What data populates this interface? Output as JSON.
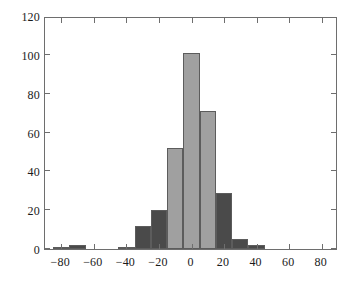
{
  "figure": {
    "name": "histogram-figure",
    "background_color": "#ffffff",
    "axis_color": "#6e6e6e",
    "text_color": "#1a1a1a"
  },
  "chart_data": {
    "type": "bar",
    "title": "",
    "subtitle": "",
    "xlabel": "",
    "ylabel": "",
    "xlim": [
      -90,
      90
    ],
    "ylim": [
      0,
      120
    ],
    "grid": false,
    "legend": null,
    "bin_width": 10,
    "xticks": [
      -80,
      -60,
      -40,
      -20,
      0,
      20,
      40,
      60,
      80
    ],
    "xtick_labels": [
      "−80",
      "−60",
      "−40",
      "−20",
      "0",
      "20",
      "40",
      "60",
      "80"
    ],
    "yticks": [
      0,
      20,
      40,
      60,
      80,
      100,
      120
    ],
    "ytick_labels": [
      "0",
      "20",
      "40",
      "60",
      "80",
      "100",
      "120"
    ],
    "colors": {
      "light_bar": "#a0a0a0",
      "dark_bar": "#4a4a4a",
      "bar_edge": "#5c5c5c"
    },
    "bin_left_edges": [
      -85,
      -75,
      -45,
      -35,
      -25,
      -15,
      -5,
      5,
      15,
      25,
      35
    ],
    "categories": [
      "-85",
      "-75",
      "-45",
      "-35",
      "-25",
      "-15",
      "-5",
      "5",
      "15",
      "25",
      "35"
    ],
    "values": [
      1,
      2,
      1,
      12,
      20,
      52,
      101,
      71,
      29,
      5,
      2
    ],
    "bars": [
      {
        "left": -85,
        "right": -75,
        "value": 1,
        "color": "dark"
      },
      {
        "left": -75,
        "right": -65,
        "value": 2,
        "color": "dark"
      },
      {
        "left": -45,
        "right": -35,
        "value": 1,
        "color": "dark"
      },
      {
        "left": -35,
        "right": -25,
        "value": 12,
        "color": "dark"
      },
      {
        "left": -25,
        "right": -15,
        "value": 20,
        "color": "dark"
      },
      {
        "left": -15,
        "right": -5,
        "value": 52,
        "color": "light"
      },
      {
        "left": -5,
        "right": 5,
        "value": 101,
        "color": "light"
      },
      {
        "left": 5,
        "right": 15,
        "value": 71,
        "color": "light"
      },
      {
        "left": 15,
        "right": 25,
        "value": 29,
        "color": "dark"
      },
      {
        "left": 25,
        "right": 35,
        "value": 5,
        "color": "dark"
      },
      {
        "left": 35,
        "right": 45,
        "value": 2,
        "color": "dark"
      }
    ]
  }
}
